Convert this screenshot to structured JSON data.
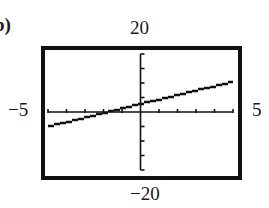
{
  "figure": {
    "partial_label": "b)",
    "window_labels": {
      "ymax": "20",
      "ymin": "−20",
      "xmin": "−5",
      "xmax": "5"
    }
  },
  "chart_data": {
    "type": "line",
    "title": "",
    "xlabel": "",
    "ylabel": "",
    "xlim": [
      -5,
      5
    ],
    "ylim": [
      -20,
      20
    ],
    "x_tick_step": 1,
    "y_tick_step": 5,
    "grid": false,
    "series": [
      {
        "name": "line",
        "x": [
          -5,
          0,
          5
        ],
        "y": [
          -4.8,
          3,
          10.7
        ],
        "style": "stair-stepped pixel line (calculator display)"
      }
    ],
    "approx_equation": "y ≈ 1.6x + 3",
    "x_intercept_approx": -2,
    "y_intercept_approx": 3
  }
}
